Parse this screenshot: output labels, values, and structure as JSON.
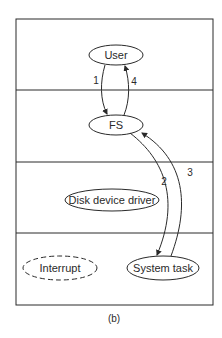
{
  "diagram": {
    "caption": "(b)",
    "layers": 4,
    "nodes": {
      "user": {
        "label": "User",
        "style": "solid"
      },
      "fs": {
        "label": "FS",
        "style": "solid"
      },
      "disk_driver": {
        "label": "Disk device driver",
        "style": "solid"
      },
      "interrupt": {
        "label": "Interrupt",
        "style": "dashed"
      },
      "system_task": {
        "label": "System task",
        "style": "solid"
      }
    },
    "edges": [
      {
        "from": "User",
        "to": "FS",
        "label": "1"
      },
      {
        "from": "FS",
        "to": "System task",
        "label": "2"
      },
      {
        "from": "System task",
        "to": "FS",
        "label": "3"
      },
      {
        "from": "FS",
        "to": "User",
        "label": "4"
      }
    ],
    "colors": {
      "stroke": "#2a2a2a",
      "background": "#ffffff"
    }
  }
}
